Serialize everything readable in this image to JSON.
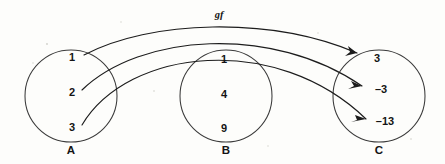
{
  "diagram": {
    "composition_label": "gf",
    "stroke_color": "#1c1c1c",
    "circle_color": "#3a3a3a",
    "background_color": "#fdfdfb"
  },
  "sets": [
    {
      "id": "A",
      "label": "A",
      "cx": 71,
      "cy": 96,
      "r": 46,
      "label_x": 71,
      "label_y": 151,
      "elements": [
        {
          "value": "1",
          "x": 72,
          "y": 58
        },
        {
          "value": "2",
          "x": 72,
          "y": 93
        },
        {
          "value": "3",
          "x": 72,
          "y": 128
        }
      ]
    },
    {
      "id": "B",
      "label": "B",
      "cx": 226,
      "cy": 96,
      "r": 46,
      "label_x": 226,
      "label_y": 151,
      "elements": [
        {
          "value": "1",
          "x": 224,
          "y": 60
        },
        {
          "value": "4",
          "x": 224,
          "y": 95
        },
        {
          "value": "9",
          "x": 224,
          "y": 129
        }
      ]
    },
    {
      "id": "C",
      "label": "C",
      "cx": 379,
      "cy": 96,
      "r": 46,
      "label_x": 379,
      "label_y": 151,
      "elements": [
        {
          "value": "3",
          "x": 377,
          "y": 59
        },
        {
          "value": "–3",
          "x": 381,
          "y": 90
        },
        {
          "value": "–13",
          "x": 385,
          "y": 122
        }
      ]
    }
  ],
  "mappings": [
    {
      "name": "arrow-1-to-3",
      "from_set": "A",
      "from_element": "1",
      "to_set": "C",
      "to_element": "3",
      "path": "M 84 55 C 150 20 270 16 357 53",
      "arrow_points": "357,53 348,46 350,52 345,56"
    },
    {
      "name": "arrow-2-to-neg3",
      "from_set": "A",
      "from_element": "–2",
      "to_set": "C",
      "to_element": "–3",
      "path": "M 82 90 C 140 34 272 24 362 86",
      "arrow_points": "362,86 351,81 354,86 348,89"
    },
    {
      "name": "arrow-3-to-neg13",
      "from_set": "A",
      "from_element": "3",
      "to_set": "C",
      "to_element": "–13",
      "path": "M 82 125 C 128 48 276 32 366 119",
      "arrow_points": "366,119 355,115 357,120 351,122"
    }
  ],
  "composition_label_position": {
    "x": 219,
    "y": 16
  }
}
